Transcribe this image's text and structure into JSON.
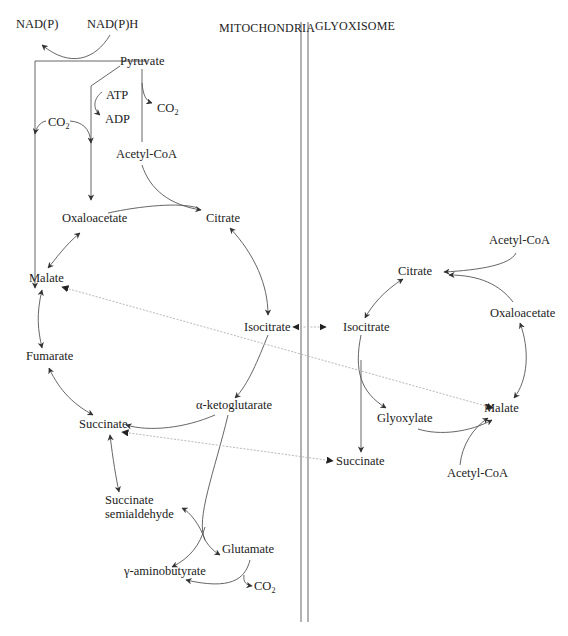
{
  "compartments": {
    "left": "MITOCHONDRIA",
    "right": "GLYOXISOME"
  },
  "mitochondria": {
    "nadp": "NAD(P)",
    "nadph": "NAD(P)H",
    "pyruvate": "Pyruvate",
    "atp": "ATP",
    "adp": "ADP",
    "co2_left": "CO",
    "co2_right": "CO",
    "acetyl_coa": "Acetyl-CoA",
    "oxaloacetate": "Oxaloacetate",
    "citrate": "Citrate",
    "malate": "Malate",
    "isocitrate": "Isocitrate",
    "fumarate": "Fumarate",
    "alpha_ketoglutarate": "α-ketoglutarate",
    "succinate": "Succinate",
    "succinate_semialdehyde_1": "Succinate",
    "succinate_semialdehyde_2": "semialdehyde",
    "glutamate": "Glutamate",
    "gaba": "γ-aminobutyrate",
    "co2_bottom": "CO"
  },
  "glyoxisome": {
    "acetyl_coa_top": "Acetyl-CoA",
    "citrate": "Citrate",
    "isocitrate": "Isocitrate",
    "oxaloacetate": "Oxaloacetate",
    "glyoxylate": "Glyoxylate",
    "malate": "Malate",
    "succinate": "Succinate",
    "acetyl_coa_bottom": "Acetyl-CoA"
  },
  "subscript": "2",
  "colors": {
    "line": "#555555",
    "dotted": "#b0b0b0",
    "text": "#222222"
  }
}
